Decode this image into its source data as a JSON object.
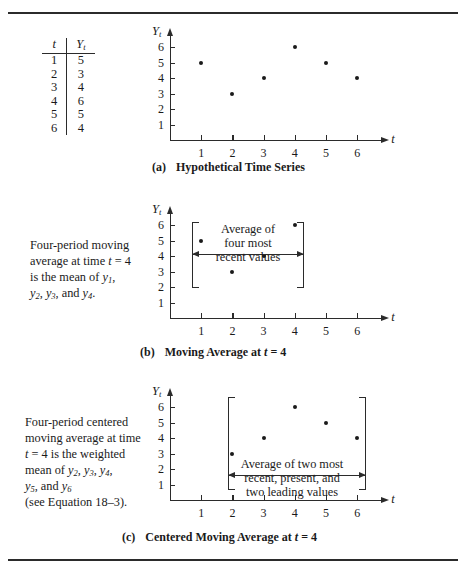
{
  "figure": {
    "axis_y_title": "Yt",
    "axis_x_title": "t",
    "y_ticks": [
      "6",
      "5",
      "4",
      "3",
      "2",
      "1"
    ],
    "x_ticks": [
      "1",
      "2",
      "3",
      "4",
      "5",
      "6"
    ]
  },
  "table": {
    "header_t": "t",
    "header_y": "Yt",
    "rows": [
      {
        "t": "1",
        "y": "5"
      },
      {
        "t": "2",
        "y": "3"
      },
      {
        "t": "3",
        "y": "4"
      },
      {
        "t": "4",
        "y": "6"
      },
      {
        "t": "5",
        "y": "5"
      },
      {
        "t": "6",
        "y": "4"
      }
    ]
  },
  "chart_data": [
    {
      "type": "scatter",
      "panel": "a",
      "title": "Hypothetical Time Series",
      "xlabel": "t",
      "ylabel": "Yt",
      "x": [
        1,
        2,
        3,
        4,
        5,
        6
      ],
      "values": [
        5,
        3,
        4,
        6,
        5,
        4
      ],
      "xlim": [
        0,
        6.7
      ],
      "ylim": [
        0,
        6.6
      ],
      "grid": false,
      "legend": "none",
      "highlight_range": null
    },
    {
      "type": "scatter",
      "panel": "b",
      "title": "Moving Average at t = 4",
      "xlabel": "t",
      "ylabel": "Yt",
      "x": [
        1,
        2,
        3,
        4
      ],
      "values": [
        5,
        3,
        4,
        6
      ],
      "xlim": [
        0,
        6.7
      ],
      "ylim": [
        0,
        6.6
      ],
      "grid": false,
      "legend": "none",
      "highlight_range": [
        1,
        4
      ],
      "annotation": "Average of four most recent values"
    },
    {
      "type": "scatter",
      "panel": "c",
      "title": "Centered Moving Average at t = 4",
      "xlabel": "t",
      "ylabel": "Yt",
      "x": [
        2,
        3,
        4,
        5,
        6
      ],
      "values": [
        3,
        4,
        6,
        5,
        4
      ],
      "xlim": [
        0,
        6.7
      ],
      "ylim": [
        0,
        6.6
      ],
      "grid": false,
      "legend": "none",
      "highlight_range": [
        2,
        6
      ],
      "annotation": "Average of two most recent, present, and two leading values"
    }
  ],
  "panel_a": {
    "caption_label": "(a)",
    "caption_text": "Hypothetical Time Series"
  },
  "panel_b": {
    "caption_label": "(b)",
    "caption_text_1": "Moving Average at ",
    "caption_it": "t",
    "caption_text_2": " = 4",
    "note_line1": "Four-period moving",
    "note_line2a": "average at time ",
    "note_line2b": "t",
    "note_line2c": " = 4",
    "note_line3a": "is the mean of ",
    "note_line3b": "y",
    "note_line3sub": "1",
    "note_line3c": ",",
    "note_line4": ", and",
    "overlay_line1": "Average of",
    "overlay_line2": "four most",
    "overlay_line3": "recent values"
  },
  "panel_c": {
    "caption_label": "(c)",
    "caption_text_1": "Centered Moving Average at ",
    "caption_it": "t",
    "caption_text_2": " = 4",
    "note_line1": "Four-period centered",
    "note_line2": "moving average at time",
    "note_line3a": "t",
    "note_line3b": " = 4 is the weighted",
    "note_line4a": "mean of ",
    "note_line5": ", and",
    "note_line6": "(see Equation 18–3).",
    "overlay_line1": "Average of two most",
    "overlay_line2": "recent, present, and",
    "overlay_line3": "two leading values"
  }
}
